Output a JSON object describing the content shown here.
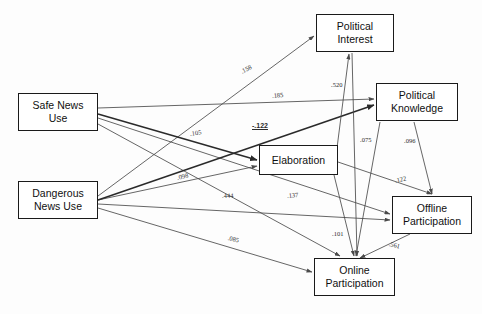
{
  "figure": {
    "type": "path-diagram",
    "title": "",
    "background_color": "#fdfdfd",
    "line_color": "#4a4a4a",
    "box_border_color": "#1a1a1a"
  },
  "nodes": [
    {
      "id": "safe_news_use",
      "label": "Safe News\nUse",
      "x": 18,
      "y": 93,
      "w": 80,
      "h": 38
    },
    {
      "id": "dangerous_news_use",
      "label": "Dangerous\nNews Use",
      "x": 18,
      "y": 181,
      "w": 80,
      "h": 38
    },
    {
      "id": "political_interest",
      "label": "Political\nInterest",
      "x": 316,
      "y": 14,
      "w": 78,
      "h": 38
    },
    {
      "id": "political_knowledge",
      "label": "Political\nKnowledge",
      "x": 376,
      "y": 83,
      "w": 82,
      "h": 38
    },
    {
      "id": "elaboration",
      "label": "Elaboration",
      "x": 259,
      "y": 145,
      "w": 79,
      "h": 30
    },
    {
      "id": "offline_participation",
      "label": "Offline\nParticipation",
      "x": 392,
      "y": 196,
      "w": 80,
      "h": 38
    },
    {
      "id": "online_participation",
      "label": "Online\nParticipation",
      "x": 314,
      "y": 258,
      "w": 81,
      "h": 38
    }
  ],
  "edges": [
    {
      "id": "e1",
      "from": "dangerous_news_use",
      "to": "political_interest",
      "coefficient": ".158",
      "bold": false,
      "label_x": 241,
      "label_y": 68,
      "label_rot": -27
    },
    {
      "id": "e2",
      "from": "safe_news_use",
      "to": "political_knowledge",
      "coefficient": ".185",
      "bold": false,
      "label_x": 272,
      "label_y": 92,
      "label_rot": -6
    },
    {
      "id": "e3",
      "from": "safe_news_use",
      "to": "elaboration",
      "coefficient": "-.122",
      "bold": true,
      "label_x": 252,
      "label_y": 122,
      "label_rot": 0
    },
    {
      "id": "e4",
      "from": "safe_news_use",
      "to": "offline_participation",
      "coefficient": ".105",
      "bold": false,
      "label_x": 190,
      "label_y": 130,
      "label_rot": -8
    },
    {
      "id": "e5",
      "from": "dangerous_news_use",
      "to": "elaboration",
      "coefficient": ".098",
      "bold": false,
      "label_x": 177,
      "label_y": 174,
      "label_rot": -14
    },
    {
      "id": "e6",
      "from": "dangerous_news_use",
      "to": "political_knowledge",
      "coefficient": ".444",
      "bold": false,
      "label_x": 222,
      "label_y": 192,
      "label_rot": -2
    },
    {
      "id": "e7",
      "from": "dangerous_news_use",
      "to": "offline_participation",
      "coefficient": ".137",
      "bold": false,
      "label_x": 287,
      "label_y": 192,
      "label_rot": -6
    },
    {
      "id": "e8",
      "from": "dangerous_news_use",
      "to": "online_participation",
      "coefficient": ".085",
      "bold": false,
      "label_x": 228,
      "label_y": 234,
      "label_rot": 13
    },
    {
      "id": "e9",
      "from": "political_interest",
      "to": "online_participation",
      "coefficient": ".520",
      "bold": false,
      "label_x": 331,
      "label_y": 81,
      "label_rot": 0
    },
    {
      "id": "e10",
      "from": "elaboration",
      "to": "political_interest",
      "coefficient": ".075",
      "bold": false,
      "label_x": 360,
      "label_y": 136,
      "label_rot": 0
    },
    {
      "id": "e11",
      "from": "political_knowledge",
      "to": "offline_participation",
      "coefficient": ".096",
      "bold": false,
      "label_x": 404,
      "label_y": 137,
      "label_rot": 0
    },
    {
      "id": "e12",
      "from": "elaboration",
      "to": "offline_participation",
      "coefficient": ".122",
      "bold": false,
      "label_x": 395,
      "label_y": 177,
      "label_rot": -13
    },
    {
      "id": "e13",
      "from": "elaboration",
      "to": "online_participation",
      "coefficient": ".101",
      "bold": false,
      "label_x": 332,
      "label_y": 230,
      "label_rot": 0
    },
    {
      "id": "e14",
      "from": "offline_participation",
      "to": "online_participation",
      "coefficient": ".561",
      "bold": false,
      "label_x": 389,
      "label_y": 240,
      "label_rot": 13
    }
  ]
}
